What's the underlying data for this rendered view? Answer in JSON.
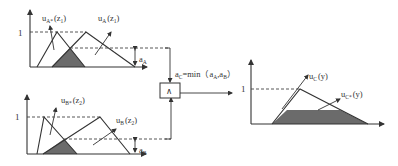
{
  "diagram": {
    "type": "fuzzy-inference-min",
    "colors": {
      "line": "#333333",
      "shade": "#6b6b6b",
      "background": "#ffffff"
    },
    "panel_a": {
      "y_tick": "1",
      "label_star": "u",
      "label_star_sub": "A*",
      "label_star_arg": "(z",
      "label_star_arg_sub": "1",
      "label_star_close": ")",
      "label_set": "u",
      "label_set_sub": "A",
      "label_set_arg": "(z",
      "label_set_arg_sub": "1",
      "label_set_close": ")",
      "alpha": "a",
      "alpha_sub": "A"
    },
    "panel_b": {
      "y_tick": "1",
      "label_star": "u",
      "label_star_sub": "B*",
      "label_star_arg": "(z",
      "label_star_arg_sub": "2",
      "label_star_close": ")",
      "label_set": "u",
      "label_set_sub": "B",
      "label_set_arg": "(z",
      "label_set_arg_sub": "2",
      "label_set_close": ")",
      "alpha": "a",
      "alpha_sub": "B"
    },
    "min_node": {
      "symbol": "∧",
      "formula_a": "a",
      "formula_a_sub": "C",
      "formula_eq": "=min（a",
      "formula_x_sub": "A",
      "formula_comma": ",a",
      "formula_y_sub": "B",
      "formula_close": "）"
    },
    "panel_c": {
      "y_tick": "1",
      "label_set": "u",
      "label_set_sub": "C",
      "label_set_arg": "(y)",
      "label_star": "u",
      "label_star_sub": "C*",
      "label_star_arg": "(y)"
    }
  }
}
